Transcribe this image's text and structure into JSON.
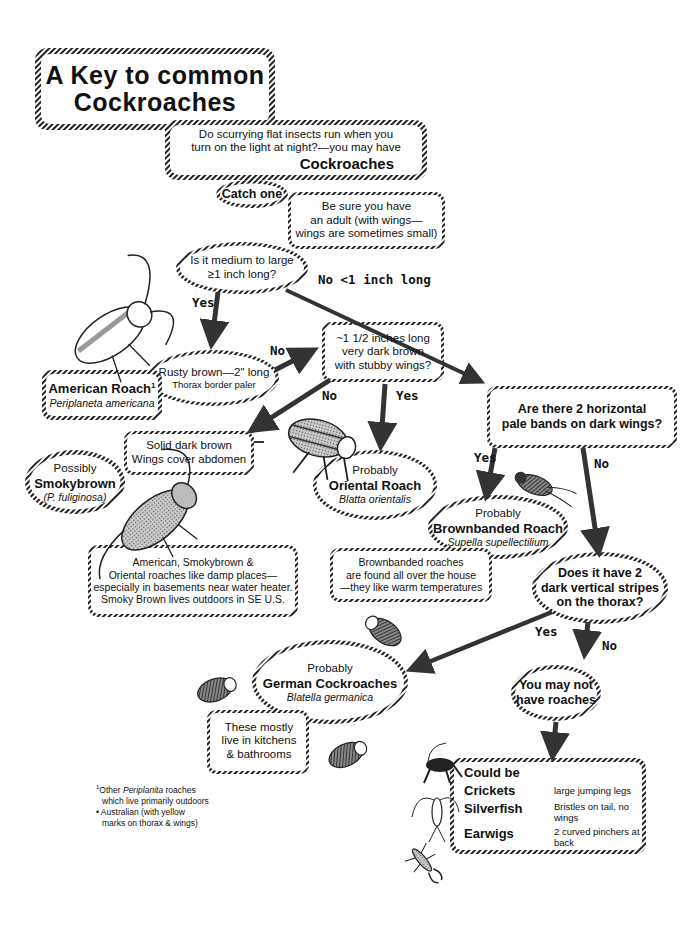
{
  "title": {
    "line1": "A Key to common",
    "line2": "Cockroaches"
  },
  "intro": {
    "line1": "Do scurrying flat insects run when you",
    "line2": "turn on the light at night?—you may have",
    "emphasis": "Cockroaches"
  },
  "catch_one": "Catch one",
  "adult_note": {
    "line1": "Be sure you have",
    "line2": "an adult (with wings—",
    "line3": "wings are sometimes small)"
  },
  "q_size": {
    "line1": "Is it medium to large",
    "line2": "≥1 inch long?"
  },
  "labels": {
    "yes_size": "Yes",
    "no_size": "No <1 inch long",
    "no_rusty": "No",
    "no_stubby": "No",
    "yes_stubby": "Yes",
    "yes_bands": "Yes",
    "no_bands": "No",
    "yes_stripes": "Yes",
    "no_stripes": "No"
  },
  "rusty": {
    "line1": "Rusty brown—2\" long",
    "line2": "Thorax border paler"
  },
  "american": {
    "name": "American Roach",
    "sup": "1",
    "latin": "Periplaneta americana"
  },
  "q_stubby": {
    "line1": "~1 1/2 inches long",
    "line2": "very dark brown",
    "line3": "with stubby wings?"
  },
  "q_bands": {
    "line1": "Are there 2 horizontal",
    "line2": "pale bands on dark wings?"
  },
  "solid_dark": {
    "line1": "Solid dark brown",
    "line2": "Wings cover abdomen"
  },
  "smokybrown": {
    "prefix": "Possibly",
    "name": "Smokybrown",
    "latin": "(P. fuliginosa)"
  },
  "oriental": {
    "prefix": "Probably",
    "name": "Oriental Roach",
    "latin": "Blatta orientalis"
  },
  "brownbanded": {
    "prefix": "Probably",
    "name": "Brownbanded Roach",
    "latin": "Supella supellectilium"
  },
  "damp_note": {
    "line1": "American, Smokybrown  &",
    "line2": "Oriental roaches like damp places—",
    "line3": "especially in basements near water heater.",
    "line4": "Smoky Brown lives outdoors in SE U.S."
  },
  "brownbanded_note": {
    "line1": "Brownbanded roaches",
    "line2": "are found all over the house",
    "line3": "—they like warm temperatures"
  },
  "q_stripes": {
    "line1": "Does it have 2",
    "line2": "dark vertical stripes",
    "line3": "on the thorax?"
  },
  "german": {
    "prefix": "Probably",
    "name": "German Cockroaches",
    "latin": "Blatella germanica"
  },
  "german_note": {
    "line1": "These mostly",
    "line2": "live in kitchens",
    "line3": "& bathrooms"
  },
  "no_roaches": {
    "line1": "You may not",
    "line2": "have roaches"
  },
  "could_be": {
    "heading": "Could be",
    "items": [
      {
        "name": "Crickets",
        "desc": "large jumping legs"
      },
      {
        "name": "Silverfish",
        "desc": "Bristles on tail, no wings"
      },
      {
        "name": "Earwigs",
        "desc": "2 curved pinchers at back"
      }
    ]
  },
  "footnote": {
    "sup": "1",
    "line1_pre": "Other ",
    "line1_italic": "Periplanita",
    "line1_post": "  roaches",
    "line2": "which live primarily outdoors",
    "line3": "• Australian (with yellow",
    "line4": "marks on thorax & wings)"
  },
  "icons": [
    "american-roach-illustration",
    "smokybrown-roach-illustration",
    "oriental-roach-illustration",
    "brownbanded-roach-illustration",
    "german-roach-illustration",
    "cricket-illustration",
    "silverfish-illustration",
    "earwig-illustration"
  ],
  "colors": {
    "ink": "#111111",
    "hatch": "#333333",
    "fill_gray": "#9a9a9a",
    "background": "#ffffff"
  }
}
